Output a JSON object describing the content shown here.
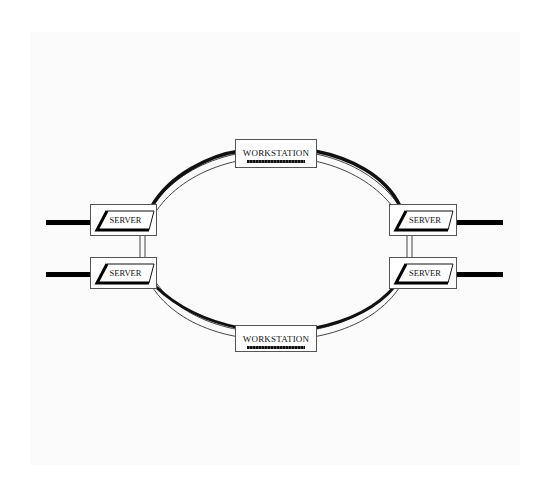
{
  "diagram": {
    "type": "ring-network",
    "nodes": {
      "workstation_top": {
        "label": "WORKSTATION"
      },
      "workstation_bottom": {
        "label": "WORKSTATION"
      },
      "server_left_top": {
        "label": "SERVER"
      },
      "server_left_bottom": {
        "label": "SERVER"
      },
      "server_right_top": {
        "label": "SERVER"
      },
      "server_right_bottom": {
        "label": "SERVER"
      }
    },
    "colors": {
      "line": "#000000",
      "box_border": "#555555",
      "background": "#fbfbfb"
    }
  }
}
